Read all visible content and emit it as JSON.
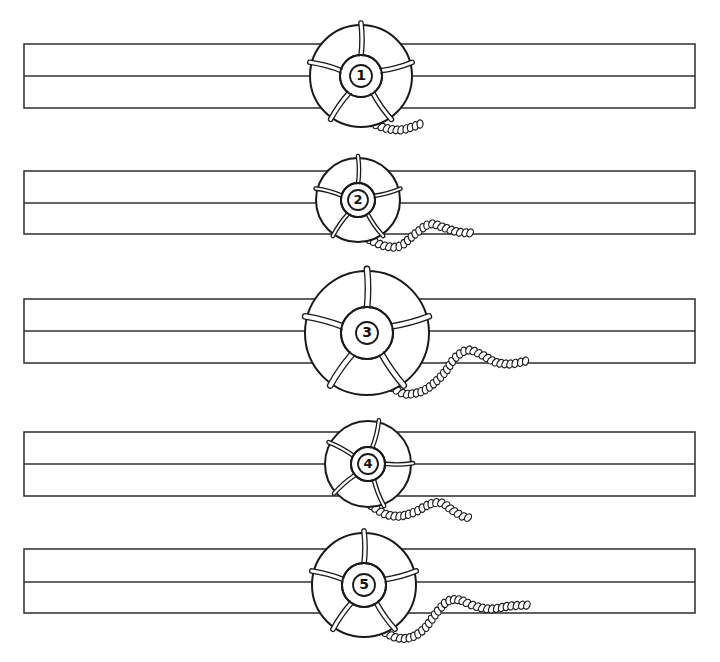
{
  "canvas": {
    "width": 720,
    "height": 662,
    "background": "#ffffff",
    "ink": "#1a1a1a"
  },
  "strips": [
    {
      "id": 1,
      "x1": 24,
      "x2": 695,
      "top": 44,
      "mid": 76,
      "bottom": 108
    },
    {
      "id": 2,
      "x1": 24,
      "x2": 695,
      "top": 171,
      "mid": 203,
      "bottom": 234
    },
    {
      "id": 3,
      "x1": 24,
      "x2": 695,
      "top": 299,
      "mid": 331,
      "bottom": 363
    },
    {
      "id": 4,
      "x1": 24,
      "x2": 695,
      "top": 432,
      "mid": 464,
      "bottom": 496
    },
    {
      "id": 5,
      "x1": 24,
      "x2": 695,
      "top": 549,
      "mid": 582,
      "bottom": 613
    }
  ],
  "rings": [
    {
      "number": "1",
      "cx": 361,
      "cy": 76,
      "r": 51,
      "inner_r": 21,
      "badge_r": 11,
      "rotation": 0,
      "rope": [
        [
          372,
          123
        ],
        [
          385,
          128
        ],
        [
          400,
          130
        ],
        [
          412,
          127
        ],
        [
          420,
          124
        ]
      ]
    },
    {
      "number": "2",
      "cx": 358,
      "cy": 200,
      "r": 42,
      "inner_r": 17,
      "badge_r": 10,
      "rotation": 0,
      "rope": [
        [
          370,
          240
        ],
        [
          385,
          246
        ],
        [
          400,
          246
        ],
        [
          415,
          234
        ],
        [
          430,
          224
        ],
        [
          445,
          228
        ],
        [
          458,
          232
        ],
        [
          472,
          233
        ]
      ]
    },
    {
      "number": "3",
      "cx": 367,
      "cy": 333,
      "r": 62,
      "inner_r": 26,
      "badge_r": 11,
      "rotation": 0,
      "rope": [
        [
          393,
          388
        ],
        [
          405,
          394
        ],
        [
          420,
          392
        ],
        [
          432,
          385
        ],
        [
          445,
          372
        ],
        [
          455,
          358
        ],
        [
          468,
          350
        ],
        [
          482,
          355
        ],
        [
          495,
          362
        ],
        [
          510,
          364
        ],
        [
          526,
          361
        ]
      ]
    },
    {
      "number": "4",
      "cx": 368,
      "cy": 464,
      "r": 43,
      "inner_r": 17,
      "badge_r": 10,
      "rotation": 14,
      "rope": [
        [
          372,
          506
        ],
        [
          385,
          514
        ],
        [
          400,
          516
        ],
        [
          415,
          512
        ],
        [
          430,
          504
        ],
        [
          442,
          503
        ],
        [
          452,
          510
        ],
        [
          462,
          516
        ],
        [
          470,
          518
        ]
      ]
    },
    {
      "number": "5",
      "cx": 364,
      "cy": 585,
      "r": 52,
      "inner_r": 22,
      "badge_r": 11,
      "rotation": 0,
      "rope": [
        [
          386,
          633
        ],
        [
          398,
          638
        ],
        [
          412,
          637
        ],
        [
          425,
          628
        ],
        [
          437,
          612
        ],
        [
          448,
          601
        ],
        [
          460,
          600
        ],
        [
          472,
          605
        ],
        [
          490,
          609
        ],
        [
          510,
          606
        ],
        [
          528,
          605
        ]
      ]
    }
  ],
  "labels": {
    "ring_1": "1",
    "ring_2": "2",
    "ring_3": "3",
    "ring_4": "4",
    "ring_5": "5"
  }
}
